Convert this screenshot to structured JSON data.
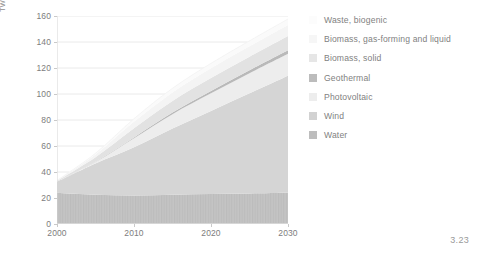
{
  "figure": {
    "number": "3.23"
  },
  "chart_data": {
    "type": "area",
    "stacked": true,
    "title": "",
    "xlabel": "",
    "ylabel": "TWh",
    "xlim": [
      2000,
      2030
    ],
    "ylim": [
      0,
      160
    ],
    "xticks": [
      2000,
      2010,
      2020,
      2030
    ],
    "xtick_labels": [
      "2000",
      "2010",
      "2020",
      "2030"
    ],
    "yticks": [
      0,
      20,
      40,
      60,
      80,
      100,
      120,
      140,
      160
    ],
    "ytick_labels": [
      "0",
      "20",
      "40",
      "60",
      "80",
      "100",
      "120",
      "140",
      "160"
    ],
    "grid": "horizontal",
    "legend_position": "right",
    "x": [
      2000,
      2005,
      2010,
      2015,
      2020,
      2025,
      2030
    ],
    "series": [
      {
        "name": "Water",
        "color": "#c2c2c2",
        "texture": "vertical-stripes",
        "values": [
          24.0,
          22.5,
          22.0,
          22.5,
          23.0,
          23.5,
          24.0
        ]
      },
      {
        "name": "Wind",
        "color": "#d5d5d5",
        "values": [
          8.5,
          24.0,
          37.0,
          51.0,
          64.0,
          77.0,
          90.0
        ]
      },
      {
        "name": "Photovoltaic",
        "color": "#ededed",
        "values": [
          0.1,
          1.2,
          7.0,
          11.0,
          13.5,
          15.5,
          17.0
        ]
      },
      {
        "name": "Geothermal",
        "color": "#b9b9b9",
        "values": [
          0.0,
          0.2,
          0.6,
          1.2,
          1.8,
          2.2,
          2.6
        ]
      },
      {
        "name": "Biomass, solid",
        "color": "#e2e2e2",
        "values": [
          0.5,
          3.5,
          7.0,
          9.0,
          10.0,
          10.5,
          11.0
        ]
      },
      {
        "name": "Biomass, gas-forming and liquid",
        "color": "#f4f4f4",
        "values": [
          0.2,
          2.0,
          5.0,
          6.5,
          7.5,
          8.0,
          8.5
        ]
      },
      {
        "name": "Waste, biogenic",
        "color": "#fafafa",
        "values": [
          0.2,
          1.0,
          2.4,
          3.2,
          3.8,
          4.2,
          4.6
        ]
      }
    ],
    "totals": [
      33.5,
      54.4,
      81.0,
      104.4,
      123.6,
      140.9,
      157.7
    ]
  },
  "legend": {
    "items": [
      {
        "label": "Waste, biogenic",
        "color": "#fcfcfc"
      },
      {
        "label": "Biomass, gas-forming and liquid",
        "color": "#f6f6f6"
      },
      {
        "label": "Biomass, solid",
        "color": "#e6e6e6"
      },
      {
        "label": "Geothermal",
        "color": "#bcbcbc"
      },
      {
        "label": "Photovoltaic",
        "color": "#ededed"
      },
      {
        "label": "Wind",
        "color": "#d2d2d2"
      },
      {
        "label": "Water",
        "color": "#bdbdbd"
      }
    ]
  }
}
